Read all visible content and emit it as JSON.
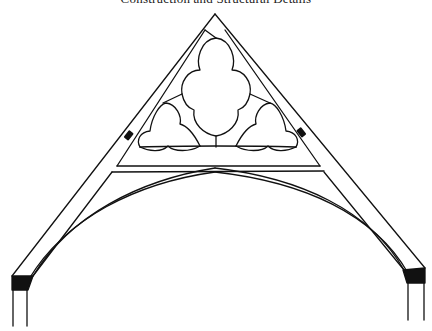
{
  "page": {
    "running_header": "Construction and Structural Details"
  },
  "diagram": {
    "stroke_color": "#111111",
    "background": "#ffffff",
    "parts": [
      "apex",
      "left-rafter",
      "right-rafter",
      "collar-beam",
      "central-quatrefoil",
      "left-trefoil",
      "right-trefoil",
      "left-peg",
      "right-peg",
      "left-arch-brace",
      "right-arch-brace",
      "left-wall-plate-block",
      "right-wall-plate-block",
      "left-post",
      "right-post"
    ]
  }
}
